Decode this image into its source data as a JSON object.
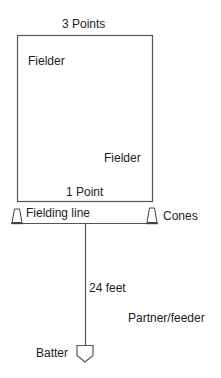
{
  "diagram": {
    "type": "drill-field-layout",
    "labels": {
      "top_score": "3 Points",
      "fielder_1": "Fielder",
      "fielder_2": "Fielder",
      "bottom_score": "1 Point",
      "fielding_line": "Fielding line",
      "cones": "Cones",
      "distance": "24 feet",
      "partner": "Partner/feeder",
      "batter": "Batter"
    },
    "shapes": {
      "scoring_box": {
        "x": 17,
        "y": 35,
        "width": 136,
        "height": 167
      },
      "fielding_line": {
        "x1": 17,
        "x2": 152,
        "y": 223
      },
      "distance_line": {
        "x": 85,
        "y1": 223,
        "y2": 345
      },
      "left_cone": {
        "cx": 17,
        "base_y": 223
      },
      "right_cone": {
        "cx": 152,
        "base_y": 223
      },
      "home_plate": {
        "cx": 85,
        "top_y": 345
      }
    },
    "colors": {
      "stroke": "#555555",
      "text": "#222222",
      "background": "#ffffff"
    }
  }
}
